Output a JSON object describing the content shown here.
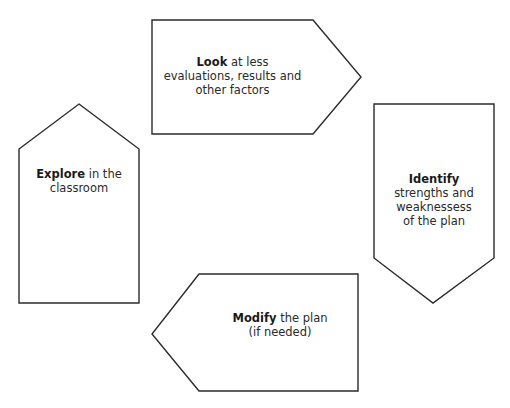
{
  "diagram": {
    "type": "cycle",
    "stroke_color": "#2b2b2b",
    "fill_color": "#ffffff",
    "steps": [
      {
        "id": "look",
        "direction": "right",
        "keyword": "Look",
        "line1_rest": " at less",
        "line2": "evaluations, results and",
        "line3": "other factors"
      },
      {
        "id": "identify",
        "direction": "down",
        "keyword": "Identify",
        "line2": "strengths and",
        "line3": "weaknessess",
        "line4": "of the plan"
      },
      {
        "id": "modify",
        "direction": "left",
        "keyword": "Modify",
        "line1_rest": " the plan",
        "line2": "(if needed)"
      },
      {
        "id": "explore",
        "direction": "up",
        "keyword": "Explore",
        "line1_rest": " in the",
        "line2": "classroom"
      }
    ]
  }
}
